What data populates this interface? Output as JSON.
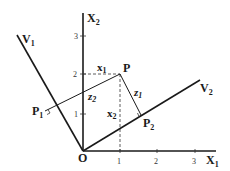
{
  "diagram": {
    "type": "coordinate-rotation-projection",
    "axes": {
      "x1_label": "X",
      "x1_sub": "1",
      "x2_label": "X",
      "x2_sub": "2",
      "origin_label": "O",
      "x1_ticks": [
        "1",
        "2",
        "3"
      ],
      "x2_ticks": [
        "1",
        "2",
        "3"
      ]
    },
    "vectors": {
      "v1_label": "V",
      "v1_sub": "1",
      "v2_label": "V",
      "v2_sub": "2"
    },
    "points": {
      "p_label": "P",
      "p1_label": "P",
      "p1_sub": "1",
      "p2_label": "P",
      "p2_sub": "2"
    },
    "segments": {
      "x1_label": "x",
      "x1_sub": "1",
      "x2_label": "x",
      "x2_sub": "2",
      "z1_label": "z",
      "z1_sub": "1",
      "z2_label": "z",
      "z2_sub": "2"
    },
    "point_P_coords": [
      1,
      2
    ],
    "colors": {
      "line": "#1a1a1a",
      "background": "#ffffff"
    }
  }
}
